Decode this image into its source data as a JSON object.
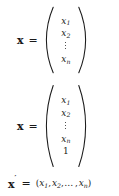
{
  "figure": {
    "type": "math-display",
    "background_color": "#ffffff",
    "text_color": "#1a1a1a"
  },
  "equations": [
    {
      "id": "vector",
      "lhs": "x",
      "lhs_prime": "",
      "relation": "=",
      "bracket": "parentheses",
      "orientation": "column",
      "entries": [
        "x₁",
        "x₂",
        "⋮",
        "xₙ"
      ],
      "rows": [
        {
          "base": "x",
          "sub": "1"
        },
        {
          "base": "x",
          "sub": "2"
        },
        {
          "base": "⋮",
          "sub": ""
        },
        {
          "base": "x",
          "sub": "n"
        }
      ]
    },
    {
      "id": "vector-homogeneous",
      "lhs": "x",
      "lhs_prime": "",
      "relation": "=",
      "bracket": "parentheses",
      "orientation": "column",
      "entries": [
        "x₁",
        "x₂",
        "⋮",
        "xₙ",
        "1"
      ],
      "rows": [
        {
          "base": "x",
          "sub": "1"
        },
        {
          "base": "x",
          "sub": "2"
        },
        {
          "base": "⋮",
          "sub": ""
        },
        {
          "base": "x",
          "sub": "n"
        },
        {
          "base": "1",
          "sub": ""
        }
      ]
    },
    {
      "id": "row-vector",
      "lhs": "x",
      "lhs_prime": "′",
      "relation": "=",
      "bracket": "parentheses",
      "orientation": "row",
      "open_paren": "(",
      "close_paren": ")",
      "comma": ",",
      "hdots": "…",
      "entries": [
        "x₁",
        "x₂",
        "…",
        "xₙ"
      ],
      "rows": [
        {
          "base": "x",
          "sub": "1"
        },
        {
          "base": "x",
          "sub": "2"
        },
        {
          "base": "x",
          "sub": "n"
        }
      ]
    }
  ]
}
